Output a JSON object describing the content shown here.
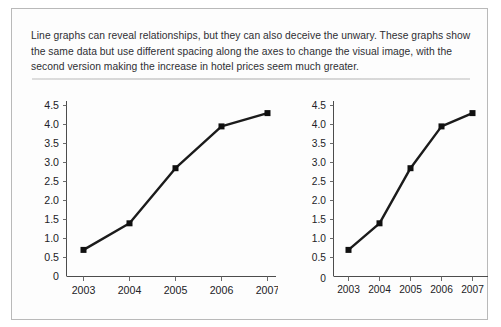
{
  "figure": {
    "caption": "Line graphs can reveal relationships, but they can also deceive the unwary. These graphs show the same data but use different spacing along the axes to change the visual image, with the second version making the increase in hotel prices seem much greater.",
    "border_color": "#b9b9b9",
    "divider_color": "#d8d8d8",
    "background_color": "#ffffff",
    "text_color": "#2f2f33"
  },
  "chart_data": [
    {
      "type": "line",
      "name": "wide-spacing-chart",
      "title": "",
      "xlabel": "",
      "ylabel": "",
      "categories": [
        "2003",
        "2004",
        "2005",
        "2006",
        "2007"
      ],
      "x": [
        2003,
        2004,
        2005,
        2006,
        2007
      ],
      "values": [
        0.7,
        1.4,
        2.85,
        3.95,
        4.3
      ],
      "ylim": [
        0,
        4.75
      ],
      "xlim": [
        2002.55,
        2007.4
      ],
      "ytick_labels": [
        "0",
        "0.5",
        "1.0",
        "1.5",
        "2.0",
        "2.5",
        "3.0",
        "3.5",
        "4.0",
        "4.5"
      ],
      "ytick_values": [
        0,
        0.5,
        1.0,
        1.5,
        2.0,
        2.5,
        3.0,
        3.5,
        4.0,
        4.5
      ],
      "xtick_labels": [
        "2003",
        "2004",
        "2005",
        "2006",
        "2007"
      ],
      "grid": false,
      "legend": false,
      "legend_position": "none",
      "marker": "square",
      "line_color": "#1b1b1b",
      "marker_color": "#101010"
    },
    {
      "type": "line",
      "name": "narrow-spacing-chart",
      "title": "",
      "xlabel": "",
      "ylabel": "",
      "categories": [
        "2003",
        "2004",
        "2005",
        "2006",
        "2007"
      ],
      "x": [
        2003,
        2004,
        2005,
        2006,
        2007
      ],
      "values": [
        0.7,
        1.4,
        2.85,
        3.95,
        4.3
      ],
      "ylim": [
        0,
        4.75
      ],
      "xlim": [
        2002.6,
        2007.35
      ],
      "ytick_labels": [
        "0",
        "0.5",
        "1.0",
        "1.5",
        "2.0",
        "2.5",
        "3.0",
        "3.5",
        "4.0",
        "4.5"
      ],
      "ytick_values": [
        0,
        0.5,
        1.0,
        1.5,
        2.0,
        2.5,
        3.0,
        3.5,
        4.0,
        4.5
      ],
      "xtick_labels": [
        "2003",
        "2004",
        "2005",
        "2006",
        "2007"
      ],
      "grid": false,
      "legend": false,
      "legend_position": "none",
      "marker": "square",
      "line_color": "#1b1b1b",
      "marker_color": "#101010"
    }
  ],
  "left_chart": {
    "ytick_labels": [
      "4.5",
      "4.0",
      "3.5",
      "3.0",
      "2.5",
      "2.0",
      "1.5",
      "1.0",
      "0.5",
      "0"
    ],
    "xtick_labels": [
      "2003",
      "2004",
      "2005",
      "2006",
      "2007"
    ]
  },
  "right_chart": {
    "ytick_labels": [
      "4.5",
      "4.0",
      "3.5",
      "3.0",
      "2.5",
      "2.0",
      "1.5",
      "1.0",
      "0.5",
      "0"
    ],
    "xtick_labels": [
      "2003",
      "2004",
      "2005",
      "2006",
      "2007"
    ]
  }
}
